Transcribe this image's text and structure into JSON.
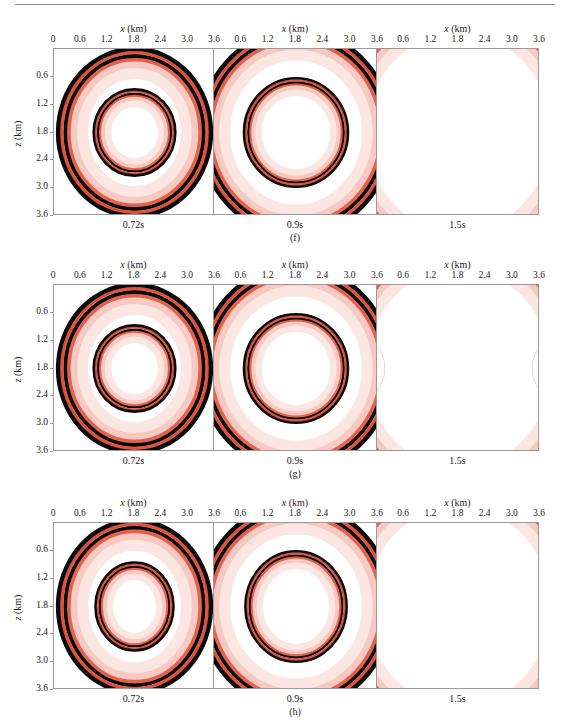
{
  "figure": {
    "rows": [
      {
        "sub_label": "(f)",
        "x_axis_label": "x (km)",
        "z_axis_label": "z (km)",
        "panels": [
          {
            "time": "0.72s"
          },
          {
            "time": "0.9s"
          },
          {
            "time": "1.5s"
          }
        ]
      },
      {
        "sub_label": "(g)",
        "x_axis_label": "x (km)",
        "z_axis_label": "z (km)",
        "panels": [
          {
            "time": "0.72s"
          },
          {
            "time": "0.9s"
          },
          {
            "time": "1.5s"
          }
        ]
      },
      {
        "sub_label": "(h)",
        "x_axis_label": "x (km)",
        "z_axis_label": "z (km)",
        "panels": [
          {
            "time": "0.72s"
          },
          {
            "time": "0.9s"
          },
          {
            "time": "1.5s"
          }
        ]
      }
    ],
    "x_ticks_first": [
      "0",
      "0.6",
      "1.2",
      "1.8",
      "2.4",
      "3.0",
      "3.6"
    ],
    "x_ticks_other": [
      "0.6",
      "1.2",
      "1.8",
      "2.4",
      "3.0",
      "3.6"
    ],
    "z_ticks": [
      "0.6",
      "1.2",
      "1.8",
      "2.4",
      "3.0",
      "3.6"
    ],
    "colors": {
      "ring_dark": "#0a0a0a",
      "ring_red": "#e0533c",
      "halo_pink": "#f4b8ad",
      "frame": "#9a9a9a"
    }
  },
  "chart_data": [
    {
      "type": "heatmap",
      "title": "(f) wavefield snapshots",
      "xlabel": "x (km)",
      "ylabel": "z (km)",
      "xlim": [
        0,
        3.6
      ],
      "ylim": [
        3.6,
        0
      ],
      "x_ticks": [
        0,
        0.6,
        1.2,
        1.8,
        2.4,
        3.0,
        3.6
      ],
      "y_ticks": [
        0.6,
        1.2,
        1.8,
        2.4,
        3.0,
        3.6
      ],
      "panels": [
        {
          "time": "0.72s",
          "source": [
            1.8,
            1.8
          ],
          "wavefronts": [
            {
              "type": "qP",
              "rx": 1.55,
              "rz": 1.65
            },
            {
              "type": "qS",
              "rx": 0.82,
              "rz": 0.84
            }
          ]
        },
        {
          "time": "0.9s",
          "source": [
            1.8,
            1.8
          ],
          "wavefronts": [
            {
              "type": "qP",
              "rx": 1.95,
              "rz": 2.05
            },
            {
              "type": "qS",
              "rx": 1.05,
              "rz": 1.08
            }
          ]
        },
        {
          "time": "1.5s",
          "source": [
            1.8,
            1.8
          ],
          "wavefronts": [
            {
              "type": "qP",
              "rx": 2.55,
              "rz": 2.65
            }
          ]
        }
      ]
    },
    {
      "type": "heatmap",
      "title": "(g) wavefield snapshots",
      "xlabel": "x (km)",
      "ylabel": "z (km)",
      "xlim": [
        0,
        3.6
      ],
      "ylim": [
        3.6,
        0
      ],
      "x_ticks": [
        0,
        0.6,
        1.2,
        1.8,
        2.4,
        3.0,
        3.6
      ],
      "y_ticks": [
        0.6,
        1.2,
        1.8,
        2.4,
        3.0,
        3.6
      ],
      "panels": [
        {
          "time": "0.72s",
          "source": [
            1.8,
            1.8
          ],
          "wavefronts": [
            {
              "type": "qP",
              "rx": 1.55,
              "rz": 1.65
            },
            {
              "type": "qS",
              "rx": 0.82,
              "rz": 0.84
            }
          ]
        },
        {
          "time": "0.9s",
          "source": [
            1.8,
            1.8
          ],
          "wavefronts": [
            {
              "type": "qP",
              "rx": 1.95,
              "rz": 2.05
            },
            {
              "type": "qS",
              "rx": 1.05,
              "rz": 1.08
            }
          ]
        },
        {
          "time": "1.5s",
          "source": [
            1.8,
            1.8
          ],
          "wavefronts": [
            {
              "type": "qP",
              "rx": 2.55,
              "rz": 2.65
            }
          ],
          "artifacts": "faint reflected arcs near left and right boundaries"
        }
      ]
    },
    {
      "type": "heatmap",
      "title": "(h) wavefield snapshots",
      "xlabel": "x (km)",
      "ylabel": "z (km)",
      "xlim": [
        0,
        3.6
      ],
      "ylim": [
        3.6,
        0
      ],
      "x_ticks": [
        0,
        0.6,
        1.2,
        1.8,
        2.4,
        3.0,
        3.6
      ],
      "y_ticks": [
        0.6,
        1.2,
        1.8,
        2.4,
        3.0,
        3.6
      ],
      "panels": [
        {
          "time": "0.72s",
          "source": [
            1.8,
            1.8
          ],
          "wavefronts": [
            {
              "type": "qP",
              "rx": 1.55,
              "rz": 1.7
            },
            {
              "type": "qS",
              "rx": 0.78,
              "rz": 0.86
            }
          ]
        },
        {
          "time": "0.9s",
          "source": [
            1.8,
            1.8
          ],
          "wavefronts": [
            {
              "type": "qP",
              "rx": 1.95,
              "rz": 2.05
            },
            {
              "type": "qS",
              "rx": 1.02,
              "rz": 1.1
            }
          ]
        },
        {
          "time": "1.5s",
          "source": [
            1.8,
            1.8
          ],
          "wavefronts": [
            {
              "type": "qP",
              "rx": 2.55,
              "rz": 2.65
            }
          ]
        }
      ]
    }
  ]
}
